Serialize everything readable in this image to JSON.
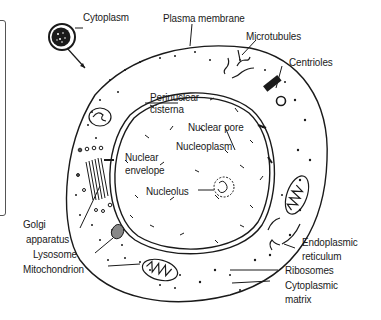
{
  "diagram": {
    "type": "labeled cell diagram (animal cell cross-section)",
    "labels": {
      "cytoplasm": "Cytoplasm",
      "plasma_membrane": "Plasma membrane",
      "microtubules": "Microtubules",
      "centrioles": "Centrioles",
      "perinuclear_cisterna_1": "Perinuclear",
      "perinuclear_cisterna_2": "cisterna",
      "nuclear_pore": "Nuclear pore",
      "nucleoplasm": "Nucleoplasm",
      "nuclear_envelope_1": "Nuclear",
      "nuclear_envelope_2": "envelope",
      "nucleolus": "Nucleolus",
      "golgi_1": "Golgi",
      "golgi_2": "apparatus",
      "lysosome": "Lysosome",
      "mitochondrion": "Mitochondrion",
      "er_1": "Endoplasmic",
      "er_2": "reticulum",
      "ribosomes": "Ribosomes",
      "cytoplasmic_matrix_1": "Cytoplasmic",
      "cytoplasmic_matrix_2": "matrix"
    },
    "colors": {
      "ink": "#1a1a1a",
      "background": "#ffffff"
    }
  }
}
